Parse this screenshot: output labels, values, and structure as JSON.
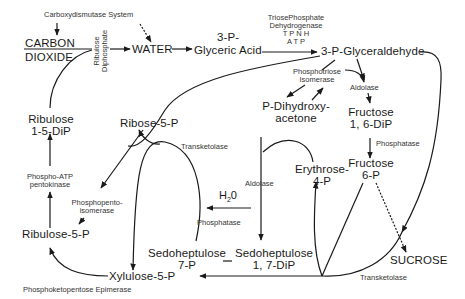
{
  "diagram": {
    "compounds": {
      "carbon_dioxide_1": "CARBON",
      "carbon_dioxide_2": "DIOXIDE",
      "water": "WATER",
      "glyceric_acid_1": "3-P-",
      "glyceric_acid_2": "Glyceric Acid",
      "glyceraldehyde": "3-P-Glyceraldehyde",
      "ribulose_dip_1": "Ribulose",
      "ribulose_dip_2": "1-5-DiP",
      "ribose_5p": "Ribose-5-P",
      "dihydroxyacetone_1": "P-Dihydroxy-",
      "dihydroxyacetone_2": "acetone",
      "fructose_dip_1": "Fructose",
      "fructose_dip_2": "1, 6-DiP",
      "fructose_6p_1": "Fructose",
      "fructose_6p_2": "6-P",
      "erythrose_1": "Erythrose-",
      "erythrose_2": "4-P",
      "ribulose_5p": "Ribulose-5-P",
      "sedoheptulose_7p_1": "Sedoheptulose",
      "sedoheptulose_7p_2": "7-P",
      "sedoheptulose_dip_1": "Sedoheptulose",
      "sedoheptulose_dip_2": "1, 7-DiP",
      "xylulose_5p": "Xylulose-5-P",
      "sucrose": "SUCROSE",
      "h2o": "H",
      "h2o_sub": "2",
      "h2o_end": "0"
    },
    "enzymes": {
      "carboxydismutase": "Carboxydismutase System",
      "ribulose_diphosphate_1": "Ribulose",
      "ribulose_diphosphate_2": "Diphosphate",
      "triose_dh_1": "TriosePhosphate",
      "triose_dh_2": "Dehydrogenase",
      "triose_dh_3": "T P N H",
      "triose_dh_4": "A T P",
      "phosphotriose_1": "Phosphotriose",
      "phosphotriose_2": "Isomerase",
      "aldolase_top": "Aldolase",
      "phosphatase_right": "Phosphatase",
      "transketolase_mid": "Transketolase",
      "phospho_atp_1": "Phospho-ATP",
      "phospho_atp_2": "pentokinase",
      "phosphopento_1": "Phosphopento-",
      "phosphopento_2": "isomerase",
      "aldolase_mid": "Aldolase",
      "phosphatase_mid": "Phosphatase",
      "transketolase_bottom": "Transketolase",
      "epimerase": "Phosphoketopentose Epimerase"
    }
  }
}
